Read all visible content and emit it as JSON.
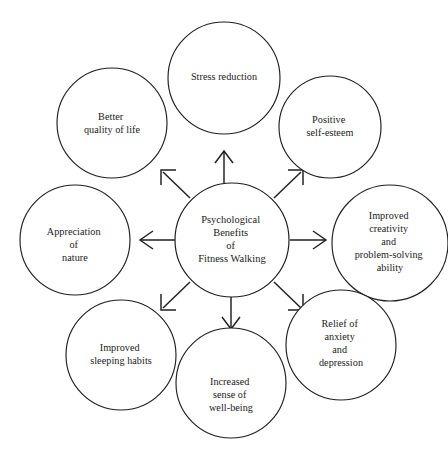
{
  "diagram": {
    "title": "Psychological Benefits of Fitness Walking",
    "type": "radial-hub-and-spoke",
    "stroke_color": "#1f1f1f",
    "fill_color": "#ffffff",
    "background_color": "#ffffff",
    "center": {
      "id": "center-hub",
      "lines": [
        "Psychological",
        "Benefits",
        "of",
        "Fitness Walking"
      ],
      "cx": 232,
      "cy": 240,
      "r": 57
    },
    "nodes": [
      {
        "id": "stress-reduction",
        "position": "top",
        "lines": [
          "Stress reduction"
        ],
        "cx": 224,
        "cy": 78,
        "r": 56
      },
      {
        "id": "positive-self-esteem",
        "position": "top-right",
        "lines": [
          "Positive",
          "self-esteem"
        ],
        "cx": 330,
        "cy": 127,
        "r": 51
      },
      {
        "id": "improved-creativity",
        "position": "right",
        "lines": [
          "Improved",
          "creativity",
          "and",
          "problem-solving",
          "ability"
        ],
        "cx": 390,
        "cy": 243,
        "r": 58
      },
      {
        "id": "relief-of-anxiety",
        "position": "bottom-right",
        "lines": [
          "Relief of",
          "anxiety",
          "and",
          "depression"
        ],
        "cx": 341,
        "cy": 345,
        "r": 55
      },
      {
        "id": "increased-well-being",
        "position": "bottom",
        "lines": [
          "Increased",
          "sense of",
          "well-being"
        ],
        "cx": 231,
        "cy": 383,
        "r": 55
      },
      {
        "id": "improved-sleeping-habits",
        "position": "bottom-left",
        "lines": [
          "Improved",
          "sleeping habits"
        ],
        "cx": 121,
        "cy": 355,
        "r": 55
      },
      {
        "id": "appreciation-of-nature",
        "position": "left",
        "lines": [
          "Appreciation",
          "of",
          "nature"
        ],
        "cx": 75,
        "cy": 240,
        "r": 55
      },
      {
        "id": "better-quality-of-life",
        "position": "top-left",
        "lines": [
          "Better",
          "quality of life"
        ],
        "cx": 112,
        "cy": 123,
        "r": 55
      }
    ],
    "arrows": [
      {
        "id": "arrow-up",
        "direction": "up",
        "head_style": "v-head"
      },
      {
        "id": "arrow-up-right",
        "direction": "up-right",
        "head_style": "l-bracket"
      },
      {
        "id": "arrow-right",
        "direction": "right",
        "head_style": "v-head"
      },
      {
        "id": "arrow-down-right",
        "direction": "down-right",
        "head_style": "l-bracket"
      },
      {
        "id": "arrow-down",
        "direction": "down",
        "head_style": "v-head"
      },
      {
        "id": "arrow-down-left",
        "direction": "down-left",
        "head_style": "l-bracket"
      },
      {
        "id": "arrow-left",
        "direction": "left",
        "head_style": "v-head"
      },
      {
        "id": "arrow-up-left",
        "direction": "up-left",
        "head_style": "l-bracket"
      }
    ]
  }
}
